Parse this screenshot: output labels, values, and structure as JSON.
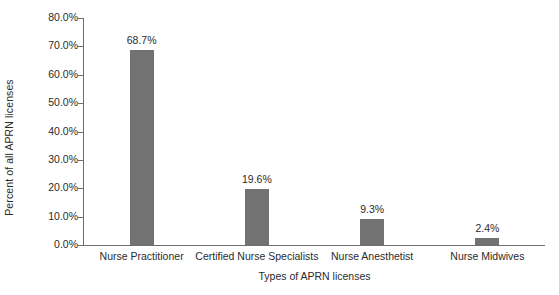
{
  "chart_data": {
    "type": "bar",
    "title": "",
    "xlabel": "Types of APRN licenses",
    "ylabel": "Percent of all APRN licenses",
    "categories": [
      "Nurse Practitioner",
      "Certified Nurse Specialists",
      "Nurse Anesthetist",
      "Nurse Midwives"
    ],
    "values": [
      68.7,
      19.6,
      9.3,
      2.4
    ],
    "data_labels": [
      "68.7%",
      "19.6%",
      "9.3%",
      "2.4%"
    ],
    "ylim": [
      0,
      80
    ],
    "ytick_values": [
      0,
      10,
      20,
      30,
      40,
      50,
      60,
      70,
      80
    ],
    "ytick_labels": [
      "0.0%",
      "10.0%",
      "20.0%",
      "30.0%",
      "40.0%",
      "50.0%",
      "60.0%",
      "70.0%",
      "80.0%"
    ],
    "grid": false,
    "legend": false,
    "legend_position": "none",
    "bar_color": "#727272",
    "axis_color": "#6e6e6e",
    "text_color": "#2b2b2b",
    "background_color": "#ffffff"
  }
}
